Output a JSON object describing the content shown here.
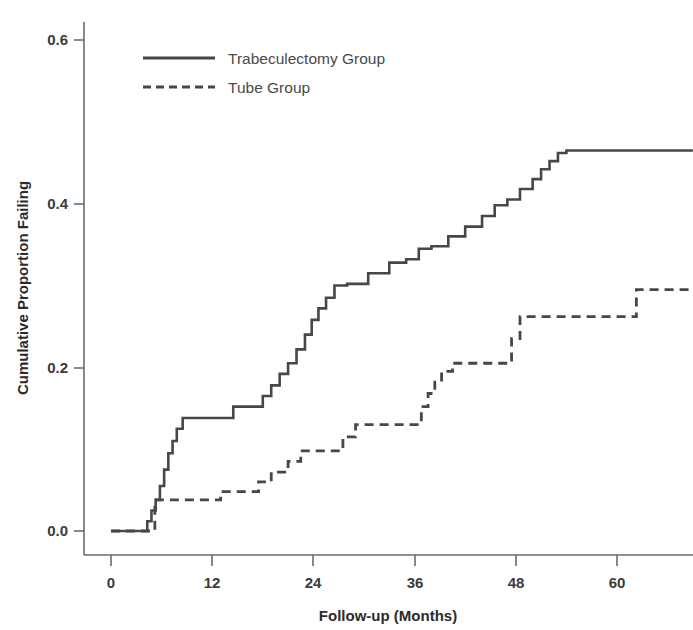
{
  "chart_data": {
    "type": "line",
    "title": "",
    "subtitle": "",
    "xlabel": "Follow-up (Months)",
    "ylabel": "Cumulative Proportion Failing",
    "xlim": [
      -4,
      69
    ],
    "ylim": [
      0.0,
      0.63
    ],
    "xticks": [
      0,
      12,
      24,
      36,
      48,
      60
    ],
    "xtick_labels": [
      "0",
      "12",
      "24",
      "36",
      "48",
      "60"
    ],
    "yticks": [
      0.0,
      0.2,
      0.4,
      0.6
    ],
    "ytick_labels": [
      "0.0",
      "0.2",
      "0.4",
      "0.6"
    ],
    "grid": false,
    "legend_position": "upper-left",
    "step_type": "post",
    "axis_color": "#6b6b6b",
    "line_color": "#474747",
    "series": [
      {
        "name": "Trabeculectomy Group",
        "style": "solid",
        "x": [
          0,
          3.8,
          4.3,
          4.8,
          5.3,
          5.8,
          6.3,
          6.8,
          7.3,
          7.8,
          8.5,
          12.5,
          14.5,
          16.5,
          18.0,
          19.0,
          20.0,
          21.0,
          22.0,
          23.0,
          23.8,
          24.6,
          25.5,
          26.5,
          28.0,
          30.5,
          33.0,
          35.0,
          36.5,
          38.0,
          40.0,
          42.0,
          44.0,
          45.5,
          47.0,
          48.5,
          50.0,
          51.0,
          52.0,
          53.0,
          54.0,
          69.0
        ],
        "y": [
          0.0,
          0.0,
          0.012,
          0.025,
          0.038,
          0.055,
          0.075,
          0.095,
          0.11,
          0.125,
          0.138,
          0.138,
          0.152,
          0.152,
          0.165,
          0.178,
          0.192,
          0.205,
          0.222,
          0.24,
          0.258,
          0.272,
          0.285,
          0.3,
          0.302,
          0.315,
          0.328,
          0.332,
          0.345,
          0.348,
          0.36,
          0.372,
          0.385,
          0.398,
          0.405,
          0.418,
          0.43,
          0.442,
          0.452,
          0.462,
          0.465,
          0.465
        ]
      },
      {
        "name": "Tube Group",
        "style": "dashed",
        "x": [
          0,
          4.8,
          5.2,
          12.0,
          13.0,
          16.0,
          17.5,
          19.0,
          21.0,
          22.5,
          26.0,
          27.5,
          29.0,
          36.0,
          36.8,
          37.6,
          38.4,
          39.2,
          40.5,
          46.5,
          47.5,
          48.5,
          61.5,
          62.3,
          69.0
        ],
        "y": [
          0.0,
          0.0,
          0.038,
          0.038,
          0.048,
          0.048,
          0.06,
          0.072,
          0.085,
          0.098,
          0.098,
          0.115,
          0.13,
          0.13,
          0.152,
          0.168,
          0.182,
          0.195,
          0.205,
          0.205,
          0.235,
          0.262,
          0.262,
          0.295,
          0.295
        ]
      }
    ]
  },
  "legend": {
    "entries": [
      {
        "label": "Trabeculectomy Group",
        "style": "solid"
      },
      {
        "label": "Tube Group",
        "style": "dashed"
      }
    ]
  },
  "axes": {
    "x_title": "Follow-up (Months)",
    "y_title": "Cumulative Proportion Failing"
  }
}
